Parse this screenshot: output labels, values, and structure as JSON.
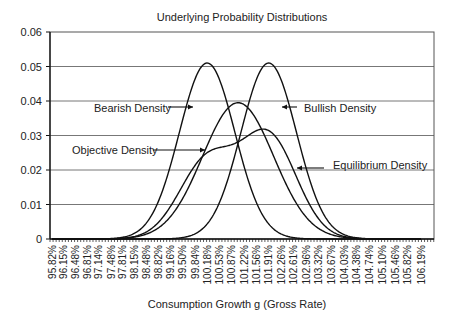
{
  "chart_data": {
    "type": "line",
    "title": "Underlying Probability Distributions",
    "xlabel": "Consumption Growth g (Gross Rate)",
    "ylabel": "",
    "ylim": [
      0,
      0.06
    ],
    "yticks": [
      "0",
      "0.01",
      "0.02",
      "0.03",
      "0.04",
      "0.05",
      "0.06"
    ],
    "grid": true,
    "x_tick_labels": [
      "95.82%",
      "96.15%",
      "96.48%",
      "96.81%",
      "97.14%",
      "97.48%",
      "97.81%",
      "98.15%",
      "98.48%",
      "98.82%",
      "99.16%",
      "99.50%",
      "99.84%",
      "100.18%",
      "100.53%",
      "100.87%",
      "101.22%",
      "101.56%",
      "101.91%",
      "102.26%",
      "102.61%",
      "102.96%",
      "103.32%",
      "103.67%",
      "104.03%",
      "104.38%",
      "104.74%",
      "105.10%",
      "105.46%",
      "105.82%",
      "106.19%"
    ],
    "xrange": [
      95.82,
      106.19
    ],
    "series": [
      {
        "name": "Bearish Density",
        "shape": "normal",
        "mean": 100.18,
        "sd": 0.78,
        "peak": 0.051
      },
      {
        "name": "Bullish Density",
        "shape": "normal",
        "mean": 101.91,
        "sd": 0.78,
        "peak": 0.051
      },
      {
        "name": "Objective Density",
        "shape": "normal",
        "mean": 101.05,
        "sd": 1.0,
        "peak": 0.0395
      },
      {
        "name": "Equilibrium Density",
        "shape": "mixture",
        "components": [
          {
            "mean": 100.18,
            "sd": 0.78,
            "peak": 0.0225
          },
          {
            "mean": 101.91,
            "sd": 0.78,
            "peak": 0.0295
          }
        ]
      }
    ],
    "annotations": [
      {
        "text": "Bearish Density",
        "arrow": "right"
      },
      {
        "text": "Bullish Density",
        "arrow": "left"
      },
      {
        "text": "Objective Density",
        "arrow": "right"
      },
      {
        "text": "Equilibrium Density",
        "arrow": "left"
      }
    ]
  }
}
